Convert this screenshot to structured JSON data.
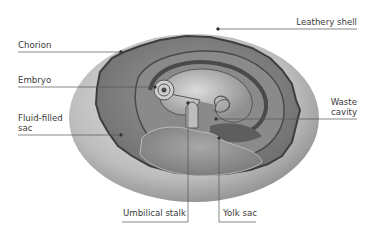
{
  "diagram": {
    "labels": {
      "chorion": "Chorion",
      "embryo": "Embryo",
      "fluid_sac_line1": "Fluid-filled",
      "fluid_sac_line2": "sac",
      "leathery_shell": "Leathery shell",
      "waste_line1": "Waste",
      "waste_line2": "cavity",
      "umbilical_stalk": "Umbilical stalk",
      "yolk_sac": "Yolk sac"
    }
  }
}
